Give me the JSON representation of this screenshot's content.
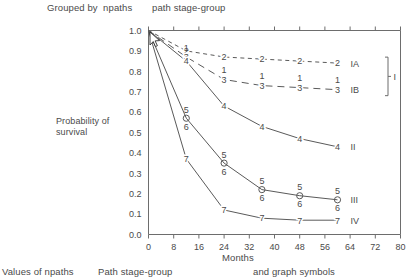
{
  "header": {
    "grouped_by": "Grouped by  npaths",
    "stage_group": "path stage-group"
  },
  "footer": {
    "values": "Values of npaths",
    "path_stage_group": "Path stage-group",
    "symbols": "and graph symbols"
  },
  "axes": {
    "ylabel": "Probability of survival",
    "xlabel": "Months",
    "xticks": [
      "0",
      "8",
      "16",
      "24",
      "32",
      "40",
      "48",
      "56",
      "64",
      "72",
      "80"
    ],
    "yticks": [
      "0.0",
      "0.1",
      "0.2",
      "0.3",
      "0.4",
      "0.5",
      "0.6",
      "0.7",
      "0.8",
      "0.9",
      "1.0"
    ]
  },
  "legend": {
    "bracket_label": "I",
    "entries": [
      "IA",
      "IB",
      "II",
      "III",
      "IV"
    ]
  },
  "chart_data": {
    "type": "line",
    "title": "",
    "xlabel": "Months",
    "ylabel": "Probability of survival",
    "xlim": [
      0,
      80
    ],
    "ylim": [
      0.0,
      1.0
    ],
    "xticks": [
      0,
      8,
      16,
      24,
      32,
      40,
      48,
      56,
      64,
      72,
      80
    ],
    "yticks": [
      0.0,
      0.1,
      0.2,
      0.3,
      0.4,
      0.5,
      0.6,
      0.7,
      0.8,
      0.9,
      1.0
    ],
    "grid": false,
    "legend_position": "right-of-axes",
    "series": [
      {
        "name": "IA",
        "group": "I",
        "symbol": "2",
        "linestyle": "dashed",
        "x": [
          0,
          12,
          24,
          36,
          48,
          60
        ],
        "y": [
          1.0,
          0.9,
          0.87,
          0.86,
          0.85,
          0.84
        ]
      },
      {
        "name": "IB",
        "group": "I",
        "symbol": "3",
        "symbol_above": "1",
        "linestyle": "long-dashed",
        "x": [
          0,
          12,
          24,
          36,
          48,
          60
        ],
        "y": [
          1.0,
          0.87,
          0.76,
          0.73,
          0.72,
          0.71
        ]
      },
      {
        "name": "II",
        "symbol": "4",
        "linestyle": "solid",
        "x": [
          0,
          12,
          24,
          36,
          48,
          60
        ],
        "y": [
          1.0,
          0.85,
          0.63,
          0.53,
          0.47,
          0.43
        ]
      },
      {
        "name": "III",
        "symbol": "5",
        "symbol_below": "6",
        "marker": "open-circle",
        "linestyle": "solid",
        "x": [
          0,
          12,
          24,
          36,
          48,
          60
        ],
        "y": [
          1.0,
          0.57,
          0.35,
          0.22,
          0.19,
          0.17
        ]
      },
      {
        "name": "IV",
        "symbol": "7",
        "linestyle": "solid",
        "x": [
          0,
          12,
          24,
          36,
          48,
          60
        ],
        "y": [
          1.0,
          0.37,
          0.12,
          0.08,
          0.07,
          0.07
        ]
      }
    ]
  }
}
